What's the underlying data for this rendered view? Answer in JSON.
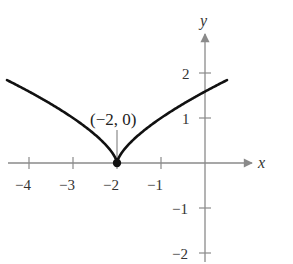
{
  "chart_data": {
    "type": "line",
    "title": "",
    "function": "y = (x + 2)^(2/3)",
    "xlabel": "x",
    "ylabel": "y",
    "xlim": [
      -4.5,
      0.9
    ],
    "ylim": [
      -2.3,
      2.6
    ],
    "grid": false,
    "x_ticks": [
      -4,
      -3,
      -2,
      -1
    ],
    "x_tick_labels": [
      "−4",
      "−3",
      "−2",
      "−1"
    ],
    "y_ticks": [
      2,
      1,
      -1,
      -2
    ],
    "y_tick_labels": [
      "2",
      "1",
      "−1",
      "−2"
    ],
    "series": [
      {
        "name": "curve",
        "x": [
          -4.5,
          -4.0,
          -3.5,
          -3.0,
          -2.5,
          -2.2,
          -2.05,
          -2.0,
          -1.95,
          -1.8,
          -1.5,
          -1.0,
          -0.5,
          0.0,
          0.5
        ],
        "y": [
          1.84,
          1.59,
          1.31,
          1.0,
          0.63,
          0.34,
          0.14,
          0.0,
          0.14,
          0.34,
          0.63,
          1.0,
          1.31,
          1.59,
          1.84
        ]
      }
    ],
    "points": [
      {
        "x": -2,
        "y": 0,
        "label": "(−2, 0)"
      }
    ],
    "annotations": [
      "(−2, 0)"
    ],
    "legend": null
  }
}
